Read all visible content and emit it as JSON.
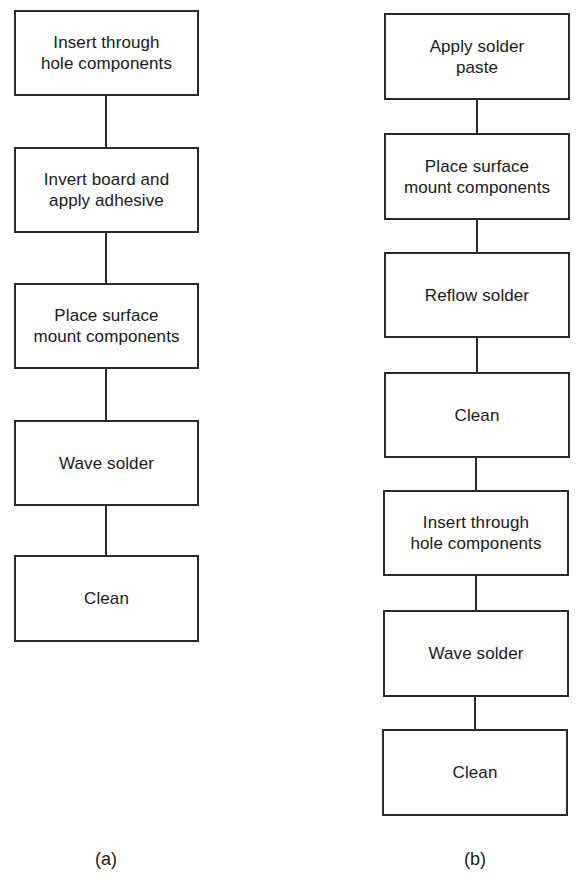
{
  "diagram": {
    "a": {
      "label": "(a)",
      "steps": [
        "Insert through\nhole components",
        "Invert board and\napply adhesive",
        "Place surface\nmount components",
        "Wave solder",
        "Clean"
      ]
    },
    "b": {
      "label": "(b)",
      "steps": [
        "Apply solder\npaste",
        "Place surface\nmount components",
        "Reflow solder",
        "Clean",
        "Insert through\nhole components",
        "Wave solder",
        "Clean"
      ]
    }
  },
  "colors": {
    "stroke": "#2a2a2a",
    "background": "#ffffff",
    "text": "#1a1a1a"
  }
}
